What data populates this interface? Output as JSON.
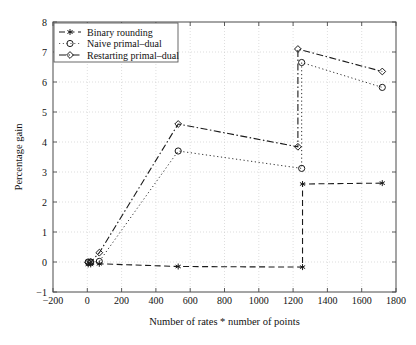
{
  "chart_data": {
    "type": "line",
    "title": "",
    "xlabel": "Number of rates * number of points",
    "ylabel": "Percentage gain",
    "xlim": [
      -200,
      1800
    ],
    "ylim": [
      -1,
      8
    ],
    "xticks": [
      -200,
      0,
      200,
      400,
      600,
      800,
      1000,
      1200,
      1400,
      1600,
      1800
    ],
    "yticks": [
      -1,
      0,
      1,
      2,
      3,
      4,
      5,
      6,
      7,
      8
    ],
    "grid": true,
    "legend_position": "upper-left",
    "series": [
      {
        "name": "Binary rounding",
        "marker": "star",
        "linestyle": "dashed",
        "x": [
          5,
          20,
          70,
          530,
          1255,
          1255,
          1720
        ],
        "y": [
          -0.08,
          -0.08,
          -0.06,
          -0.15,
          -0.17,
          2.6,
          2.63
        ]
      },
      {
        "name": "Naive primal-dual",
        "marker": "circle",
        "linestyle": "dotted",
        "x": [
          5,
          20,
          70,
          530,
          1250,
          1250,
          1720
        ],
        "y": [
          0.0,
          0.0,
          0.02,
          3.7,
          3.12,
          6.65,
          5.82
        ]
      },
      {
        "name": "Restarting primal-dual",
        "marker": "diamond",
        "linestyle": "dash-dot",
        "x": [
          5,
          20,
          70,
          530,
          1228,
          1228,
          1720
        ],
        "y": [
          -0.02,
          0.0,
          0.31,
          4.6,
          3.84,
          7.1,
          6.35
        ]
      }
    ]
  },
  "legend": {
    "entries": [
      {
        "label": "Binary rounding"
      },
      {
        "label": "Naive primal–dual"
      },
      {
        "label": "Restarting primal–dual"
      }
    ]
  },
  "axes": {
    "x_tick_labels": [
      "−200",
      "0",
      "200",
      "400",
      "600",
      "800",
      "1000",
      "1200",
      "1400",
      "1600",
      "1800"
    ],
    "y_tick_labels": [
      "−1",
      "0",
      "1",
      "2",
      "3",
      "4",
      "5",
      "6",
      "7",
      "8"
    ],
    "x_axis_title": "Number of rates * number of points",
    "y_axis_title": "Percentage gain"
  },
  "colors": {
    "ink": "#1a1a1a",
    "frame": "#4a4a4a",
    "grid": "#c8c8c8",
    "background": "#ffffff"
  }
}
